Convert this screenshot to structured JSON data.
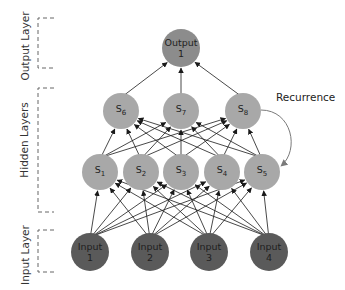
{
  "diagram": {
    "title": "",
    "layers": [
      {
        "id": "output",
        "label": "Output Layer"
      },
      {
        "id": "hidden",
        "label": "Hidden Layers"
      },
      {
        "id": "input",
        "label": "Input Layer"
      }
    ],
    "nodes": {
      "output": [
        {
          "id": "out1",
          "line1": "Output",
          "line2": "1"
        }
      ],
      "hidden_top": [
        {
          "id": "s6",
          "label": "S",
          "sub": "6"
        },
        {
          "id": "s7",
          "label": "S",
          "sub": "7"
        },
        {
          "id": "s8",
          "label": "S",
          "sub": "8"
        }
      ],
      "hidden_bottom": [
        {
          "id": "s1",
          "label": "S",
          "sub": "1"
        },
        {
          "id": "s2",
          "label": "S",
          "sub": "2"
        },
        {
          "id": "s3",
          "label": "S",
          "sub": "3"
        },
        {
          "id": "s4",
          "label": "S",
          "sub": "4"
        },
        {
          "id": "s5",
          "label": "S",
          "sub": "5"
        }
      ],
      "input": [
        {
          "id": "in1",
          "line1": "Input",
          "line2": "1"
        },
        {
          "id": "in2",
          "line1": "Input",
          "line2": "2"
        },
        {
          "id": "in3",
          "line1": "Input",
          "line2": "3"
        },
        {
          "id": "in4",
          "line1": "Input",
          "line2": "4"
        }
      ]
    },
    "edges": {
      "input_to_hidden_bottom": "fully connected (4 x 5)",
      "hidden_bottom_to_hidden_top": "fully connected (5 x 3)",
      "hidden_top_to_output": "fully connected (3 x 1)"
    },
    "recurrence": {
      "label": "Recurrence",
      "from": "s8",
      "to": "s5"
    },
    "colors": {
      "output_node": "#8c8c8c",
      "hidden_node": "#a8a8a8",
      "input_node": "#5a5a5a",
      "edge": "#1a1a1a",
      "recurrence_edge": "#7a7a7a",
      "bracket": "#666666"
    }
  }
}
